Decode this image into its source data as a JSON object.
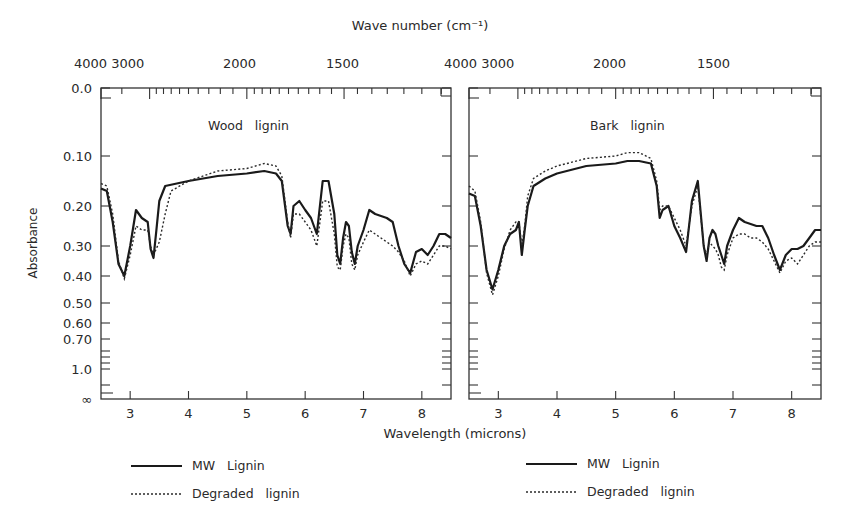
{
  "chart_data": [
    {
      "type": "line",
      "title": "Wood lignin",
      "xlabel": "Wavelength (microns)",
      "ylabel": "Absorbance",
      "top_axis_label": "Wave number (cm⁻¹)",
      "xlim": [
        2.5,
        8.5
      ],
      "x_ticks": [
        "3",
        "4",
        "5",
        "6",
        "7",
        "8"
      ],
      "top_ticks": [
        {
          "label": "4000",
          "x": 2.5
        },
        {
          "label": "3000",
          "x": 3.33
        },
        {
          "label": "2000",
          "x": 5.0
        },
        {
          "label": "1500",
          "x": 6.67
        }
      ],
      "y_ticks": [
        "0.0",
        "0.10",
        "0.20",
        "0.30",
        "0.40",
        "0.50",
        "0.60",
        "0.70",
        "1.0",
        "∞"
      ],
      "series": [
        {
          "name": "MW Lignin",
          "style": "solid",
          "x": [
            2.5,
            2.6,
            2.7,
            2.8,
            2.9,
            3.0,
            3.1,
            3.2,
            3.3,
            3.35,
            3.4,
            3.45,
            3.5,
            3.6,
            3.8,
            4.0,
            4.5,
            5.0,
            5.3,
            5.5,
            5.6,
            5.7,
            5.75,
            5.8,
            5.9,
            6.0,
            6.1,
            6.2,
            6.3,
            6.4,
            6.5,
            6.55,
            6.6,
            6.65,
            6.7,
            6.75,
            6.8,
            6.85,
            6.9,
            7.0,
            7.1,
            7.2,
            7.3,
            7.4,
            7.5,
            7.6,
            7.7,
            7.8,
            7.9,
            8.0,
            8.1,
            8.2,
            8.3,
            8.4,
            8.5
          ],
          "y": [
            0.165,
            0.17,
            0.24,
            0.36,
            0.4,
            0.3,
            0.21,
            0.23,
            0.24,
            0.31,
            0.34,
            0.26,
            0.19,
            0.16,
            0.155,
            0.15,
            0.14,
            0.135,
            0.13,
            0.135,
            0.15,
            0.25,
            0.27,
            0.2,
            0.19,
            0.21,
            0.23,
            0.27,
            0.15,
            0.15,
            0.22,
            0.33,
            0.36,
            0.28,
            0.24,
            0.25,
            0.32,
            0.36,
            0.3,
            0.26,
            0.21,
            0.22,
            0.225,
            0.23,
            0.24,
            0.3,
            0.36,
            0.39,
            0.32,
            0.31,
            0.33,
            0.3,
            0.27,
            0.27,
            0.28
          ]
        },
        {
          "name": "Degraded lignin",
          "style": "dotted",
          "x": [
            2.5,
            2.6,
            2.7,
            2.8,
            2.9,
            3.0,
            3.1,
            3.2,
            3.3,
            3.35,
            3.4,
            3.5,
            3.6,
            3.7,
            4.0,
            4.5,
            5.0,
            5.3,
            5.5,
            5.6,
            5.7,
            5.75,
            5.8,
            5.9,
            6.0,
            6.1,
            6.2,
            6.3,
            6.4,
            6.5,
            6.55,
            6.6,
            6.65,
            6.7,
            6.75,
            6.8,
            6.85,
            6.9,
            7.0,
            7.1,
            7.2,
            7.3,
            7.4,
            7.5,
            7.6,
            7.7,
            7.8,
            7.9,
            8.0,
            8.1,
            8.2,
            8.3,
            8.4,
            8.5
          ],
          "y": [
            0.155,
            0.16,
            0.22,
            0.35,
            0.41,
            0.33,
            0.25,
            0.26,
            0.26,
            0.3,
            0.33,
            0.29,
            0.22,
            0.17,
            0.15,
            0.13,
            0.125,
            0.115,
            0.12,
            0.14,
            0.24,
            0.28,
            0.22,
            0.22,
            0.24,
            0.26,
            0.3,
            0.19,
            0.19,
            0.27,
            0.37,
            0.38,
            0.3,
            0.27,
            0.28,
            0.36,
            0.38,
            0.33,
            0.29,
            0.26,
            0.27,
            0.28,
            0.29,
            0.3,
            0.32,
            0.35,
            0.4,
            0.36,
            0.35,
            0.36,
            0.33,
            0.3,
            0.3,
            0.31
          ]
        }
      ]
    },
    {
      "type": "line",
      "title": "Bark lignin",
      "xlabel": "Wavelength (microns)",
      "ylabel": "Absorbance",
      "top_axis_label": "Wave number (cm⁻¹)",
      "xlim": [
        2.5,
        8.5
      ],
      "x_ticks": [
        "3",
        "4",
        "5",
        "6",
        "7",
        "8"
      ],
      "top_ticks": [
        {
          "label": "4000",
          "x": 2.5
        },
        {
          "label": "3000",
          "x": 3.33
        },
        {
          "label": "2000",
          "x": 5.0
        },
        {
          "label": "1500",
          "x": 6.67
        }
      ],
      "y_ticks": [
        "0.0",
        "0.10",
        "0.20",
        "0.30",
        "0.40",
        "0.50",
        "0.60",
        "0.70",
        "1.0",
        "∞"
      ],
      "series": [
        {
          "name": "MW Lignin",
          "style": "solid",
          "x": [
            2.5,
            2.6,
            2.7,
            2.8,
            2.9,
            3.0,
            3.1,
            3.2,
            3.3,
            3.35,
            3.4,
            3.45,
            3.5,
            3.6,
            3.8,
            4.0,
            4.5,
            5.0,
            5.2,
            5.4,
            5.6,
            5.7,
            5.75,
            5.8,
            5.9,
            6.0,
            6.1,
            6.2,
            6.3,
            6.4,
            6.5,
            6.55,
            6.6,
            6.65,
            6.7,
            6.75,
            6.8,
            6.85,
            6.9,
            7.0,
            7.1,
            7.2,
            7.3,
            7.4,
            7.5,
            7.6,
            7.7,
            7.8,
            7.9,
            8.0,
            8.1,
            8.2,
            8.3,
            8.4,
            8.5
          ],
          "y": [
            0.175,
            0.18,
            0.25,
            0.38,
            0.45,
            0.38,
            0.3,
            0.27,
            0.26,
            0.24,
            0.33,
            0.26,
            0.2,
            0.16,
            0.145,
            0.135,
            0.12,
            0.115,
            0.11,
            0.11,
            0.115,
            0.16,
            0.23,
            0.21,
            0.2,
            0.25,
            0.28,
            0.32,
            0.19,
            0.15,
            0.3,
            0.35,
            0.28,
            0.26,
            0.27,
            0.3,
            0.33,
            0.36,
            0.3,
            0.26,
            0.23,
            0.24,
            0.245,
            0.25,
            0.25,
            0.28,
            0.33,
            0.38,
            0.33,
            0.31,
            0.31,
            0.3,
            0.28,
            0.26,
            0.26
          ]
        },
        {
          "name": "Degraded lignin",
          "style": "dotted",
          "x": [
            2.5,
            2.6,
            2.7,
            2.8,
            2.9,
            3.0,
            3.1,
            3.2,
            3.3,
            3.35,
            3.4,
            3.45,
            3.5,
            3.6,
            3.8,
            4.0,
            4.5,
            5.0,
            5.2,
            5.4,
            5.6,
            5.7,
            5.75,
            5.8,
            5.9,
            6.0,
            6.1,
            6.2,
            6.3,
            6.4,
            6.5,
            6.55,
            6.6,
            6.65,
            6.7,
            6.75,
            6.8,
            6.85,
            6.9,
            7.0,
            7.1,
            7.2,
            7.3,
            7.4,
            7.5,
            7.6,
            7.7,
            7.8,
            7.9,
            8.0,
            8.1,
            8.2,
            8.3,
            8.4,
            8.5
          ],
          "y": [
            0.16,
            0.17,
            0.24,
            0.39,
            0.47,
            0.4,
            0.31,
            0.26,
            0.24,
            0.24,
            0.3,
            0.25,
            0.18,
            0.145,
            0.13,
            0.12,
            0.105,
            0.1,
            0.095,
            0.095,
            0.105,
            0.15,
            0.21,
            0.2,
            0.2,
            0.23,
            0.26,
            0.3,
            0.2,
            0.16,
            0.3,
            0.33,
            0.29,
            0.3,
            0.31,
            0.33,
            0.37,
            0.38,
            0.33,
            0.28,
            0.27,
            0.27,
            0.28,
            0.28,
            0.29,
            0.31,
            0.35,
            0.39,
            0.35,
            0.34,
            0.36,
            0.33,
            0.3,
            0.29,
            0.29
          ]
        }
      ]
    }
  ],
  "figure": {
    "top_axis_label": "Wave number (cm⁻¹)",
    "top_ticks_left": [
      "4000 3000",
      "2000",
      "1500"
    ],
    "top_ticks_right": [
      "4000 3000",
      "2000",
      "1500"
    ],
    "ylabel": "Absorbance",
    "xlabel": "Wavelength (microns)",
    "panel_titles": [
      "Wood   lignin",
      "Bark   lignin"
    ],
    "legend_left": [
      {
        "label": "MW   Lignin",
        "style": "solid"
      },
      {
        "label": "Degraded   lignin",
        "style": "dotted"
      }
    ],
    "legend_right": [
      {
        "label": "MW   Lignin",
        "style": "solid"
      },
      {
        "label": "Degraded   lignin",
        "style": "dotted"
      }
    ]
  }
}
